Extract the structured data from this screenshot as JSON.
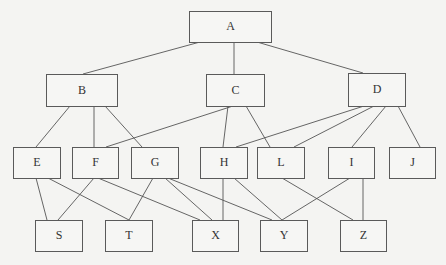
{
  "diagram": {
    "type": "hierarchy-graph",
    "nodes": [
      {
        "id": "A",
        "label": "A",
        "x": 189,
        "y": 11,
        "w": 82,
        "h": 31
      },
      {
        "id": "B",
        "label": "B",
        "x": 46,
        "y": 74,
        "w": 71,
        "h": 32
      },
      {
        "id": "C",
        "label": "C",
        "x": 206,
        "y": 74,
        "w": 58,
        "h": 32
      },
      {
        "id": "D",
        "label": "D",
        "x": 348,
        "y": 73,
        "w": 57,
        "h": 33
      },
      {
        "id": "E",
        "label": "E",
        "x": 13,
        "y": 147,
        "w": 47,
        "h": 31
      },
      {
        "id": "F",
        "label": "F",
        "x": 72,
        "y": 147,
        "w": 46,
        "h": 31
      },
      {
        "id": "G",
        "label": "G",
        "x": 131,
        "y": 147,
        "w": 47,
        "h": 31
      },
      {
        "id": "H",
        "label": "H",
        "x": 200,
        "y": 147,
        "w": 47,
        "h": 31
      },
      {
        "id": "L",
        "label": "L",
        "x": 257,
        "y": 147,
        "w": 47,
        "h": 31
      },
      {
        "id": "I",
        "label": "I",
        "x": 328,
        "y": 147,
        "w": 46,
        "h": 31
      },
      {
        "id": "J",
        "label": "J",
        "x": 389,
        "y": 147,
        "w": 46,
        "h": 31
      },
      {
        "id": "S",
        "label": "S",
        "x": 35,
        "y": 220,
        "w": 47,
        "h": 31
      },
      {
        "id": "T",
        "label": "T",
        "x": 105,
        "y": 220,
        "w": 47,
        "h": 31
      },
      {
        "id": "X",
        "label": "X",
        "x": 192,
        "y": 220,
        "w": 46,
        "h": 31
      },
      {
        "id": "Y",
        "label": "Y",
        "x": 260,
        "y": 220,
        "w": 47,
        "h": 31
      },
      {
        "id": "Z",
        "label": "Z",
        "x": 340,
        "y": 220,
        "w": 46,
        "h": 31
      }
    ],
    "edges": [
      {
        "from": "A",
        "to": "B",
        "x1": 200,
        "y1": 42,
        "x2": 83,
        "y2": 74
      },
      {
        "from": "A",
        "to": "C",
        "x1": 234,
        "y1": 42,
        "x2": 234,
        "y2": 74
      },
      {
        "from": "A",
        "to": "D",
        "x1": 257,
        "y1": 42,
        "x2": 363,
        "y2": 73
      },
      {
        "from": "B",
        "to": "E",
        "x1": 70,
        "y1": 106,
        "x2": 36,
        "y2": 147
      },
      {
        "from": "B",
        "to": "F",
        "x1": 94,
        "y1": 106,
        "x2": 94,
        "y2": 147
      },
      {
        "from": "B",
        "to": "G",
        "x1": 105,
        "y1": 106,
        "x2": 142,
        "y2": 147
      },
      {
        "from": "C",
        "to": "F",
        "x1": 233,
        "y1": 106,
        "x2": 106,
        "y2": 147
      },
      {
        "from": "C",
        "to": "H",
        "x1": 228,
        "y1": 106,
        "x2": 223,
        "y2": 147
      },
      {
        "from": "C",
        "to": "L",
        "x1": 246,
        "y1": 106,
        "x2": 270,
        "y2": 147
      },
      {
        "from": "D",
        "to": "H",
        "x1": 364,
        "y1": 106,
        "x2": 236,
        "y2": 147
      },
      {
        "from": "D",
        "to": "L",
        "x1": 374,
        "y1": 106,
        "x2": 294,
        "y2": 147
      },
      {
        "from": "D",
        "to": "I",
        "x1": 386,
        "y1": 106,
        "x2": 352,
        "y2": 147
      },
      {
        "from": "D",
        "to": "J",
        "x1": 398,
        "y1": 106,
        "x2": 420,
        "y2": 147
      },
      {
        "from": "E",
        "to": "S",
        "x1": 36,
        "y1": 178,
        "x2": 47,
        "y2": 220
      },
      {
        "from": "E",
        "to": "T",
        "x1": 48,
        "y1": 178,
        "x2": 129,
        "y2": 220
      },
      {
        "from": "F",
        "to": "S",
        "x1": 94,
        "y1": 178,
        "x2": 58,
        "y2": 220
      },
      {
        "from": "F",
        "to": "X",
        "x1": 98,
        "y1": 178,
        "x2": 200,
        "y2": 220
      },
      {
        "from": "G",
        "to": "T",
        "x1": 153,
        "y1": 178,
        "x2": 129,
        "y2": 220
      },
      {
        "from": "G",
        "to": "X",
        "x1": 165,
        "y1": 178,
        "x2": 212,
        "y2": 220
      },
      {
        "from": "G",
        "to": "Y",
        "x1": 168,
        "y1": 178,
        "x2": 272,
        "y2": 220
      },
      {
        "from": "H",
        "to": "X",
        "x1": 223,
        "y1": 178,
        "x2": 223,
        "y2": 220
      },
      {
        "from": "H",
        "to": "Y",
        "x1": 234,
        "y1": 178,
        "x2": 282,
        "y2": 220
      },
      {
        "from": "L",
        "to": "Z",
        "x1": 282,
        "y1": 178,
        "x2": 353,
        "y2": 220
      },
      {
        "from": "I",
        "to": "Y",
        "x1": 350,
        "y1": 178,
        "x2": 282,
        "y2": 220
      },
      {
        "from": "I",
        "to": "Z",
        "x1": 363,
        "y1": 178,
        "x2": 363,
        "y2": 220
      }
    ]
  }
}
